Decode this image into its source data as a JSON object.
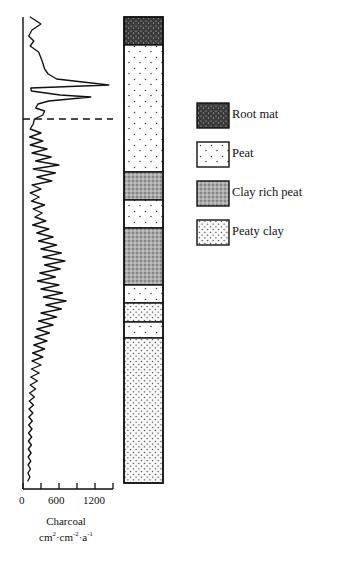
{
  "chart_data": {
    "type": "line",
    "title": "",
    "orientation": "vertical-depth-profile",
    "xlabel": "Charcoal",
    "xlabel_units": "cm2·cm-2·a-1",
    "ylabel": "",
    "xlim": [
      0,
      1500
    ],
    "xticks": [
      0,
      300,
      600,
      900,
      1200,
      1500
    ],
    "xtick_labels": [
      "0",
      "",
      "600",
      "",
      "1200",
      ""
    ],
    "grid": false,
    "legend_position": "right",
    "marker_line": {
      "type": "dashed-horizontal",
      "depth_px": 119
    },
    "series": [
      {
        "name": "Charcoal accumulation",
        "points": [
          [
            120,
            17
          ],
          [
            300,
            24
          ],
          [
            150,
            30
          ],
          [
            95,
            36
          ],
          [
            180,
            41
          ],
          [
            120,
            46
          ],
          [
            260,
            52
          ],
          [
            300,
            58
          ],
          [
            330,
            63
          ],
          [
            360,
            69
          ],
          [
            420,
            74
          ],
          [
            560,
            79
          ],
          [
            1430,
            85
          ],
          [
            130,
            88
          ],
          [
            140,
            91
          ],
          [
            620,
            95
          ],
          [
            1130,
            97
          ],
          [
            430,
            101
          ],
          [
            250,
            104
          ],
          [
            210,
            108
          ],
          [
            360,
            111
          ],
          [
            330,
            115
          ],
          [
            190,
            119
          ],
          [
            170,
            124
          ],
          [
            120,
            129
          ],
          [
            300,
            133
          ],
          [
            110,
            137
          ],
          [
            330,
            141
          ],
          [
            120,
            145
          ],
          [
            400,
            149
          ],
          [
            150,
            153
          ],
          [
            470,
            157
          ],
          [
            210,
            161
          ],
          [
            600,
            165
          ],
          [
            170,
            169
          ],
          [
            540,
            173
          ],
          [
            230,
            177
          ],
          [
            480,
            181
          ],
          [
            150,
            185
          ],
          [
            300,
            189
          ],
          [
            120,
            193
          ],
          [
            270,
            197
          ],
          [
            140,
            201
          ],
          [
            360,
            205
          ],
          [
            170,
            209
          ],
          [
            320,
            213
          ],
          [
            200,
            217
          ],
          [
            380,
            221
          ],
          [
            160,
            225
          ],
          [
            430,
            229
          ],
          [
            230,
            233
          ],
          [
            500,
            237
          ],
          [
            260,
            241
          ],
          [
            560,
            245
          ],
          [
            300,
            249
          ],
          [
            640,
            253
          ],
          [
            330,
            257
          ],
          [
            700,
            261
          ],
          [
            360,
            265
          ],
          [
            620,
            269
          ],
          [
            280,
            273
          ],
          [
            540,
            277
          ],
          [
            240,
            281
          ],
          [
            600,
            285
          ],
          [
            300,
            289
          ],
          [
            660,
            293
          ],
          [
            340,
            297
          ],
          [
            720,
            301
          ],
          [
            380,
            305
          ],
          [
            640,
            309
          ],
          [
            300,
            313
          ],
          [
            560,
            317
          ],
          [
            260,
            321
          ],
          [
            500,
            325
          ],
          [
            230,
            329
          ],
          [
            440,
            333
          ],
          [
            200,
            337
          ],
          [
            400,
            341
          ],
          [
            180,
            345
          ],
          [
            360,
            349
          ],
          [
            160,
            353
          ],
          [
            330,
            357
          ],
          [
            150,
            361
          ],
          [
            300,
            365
          ],
          [
            140,
            369
          ],
          [
            270,
            373
          ],
          [
            130,
            377
          ],
          [
            240,
            381
          ],
          [
            120,
            385
          ],
          [
            210,
            389
          ],
          [
            110,
            393
          ],
          [
            190,
            397
          ],
          [
            105,
            401
          ],
          [
            175,
            405
          ],
          [
            100,
            409
          ],
          [
            165,
            413
          ],
          [
            98,
            417
          ],
          [
            155,
            421
          ],
          [
            95,
            425
          ],
          [
            150,
            429
          ],
          [
            92,
            433
          ],
          [
            145,
            437
          ],
          [
            90,
            441
          ],
          [
            140,
            445
          ],
          [
            88,
            449
          ],
          [
            135,
            453
          ],
          [
            86,
            457
          ],
          [
            130,
            461
          ],
          [
            84,
            465
          ],
          [
            125,
            469
          ],
          [
            82,
            473
          ],
          [
            115,
            477
          ],
          [
            80,
            481
          ]
        ]
      }
    ],
    "stratigraphy": {
      "column_top_px": 17,
      "column_bottom_px": 483,
      "layers": [
        {
          "material": "Root mat",
          "top_px": 17,
          "bottom_px": 45
        },
        {
          "material": "Peat",
          "top_px": 45,
          "bottom_px": 172
        },
        {
          "material": "Clay rich peat",
          "top_px": 172,
          "bottom_px": 200
        },
        {
          "material": "Peat",
          "top_px": 200,
          "bottom_px": 228
        },
        {
          "material": "Clay rich peat",
          "top_px": 228,
          "bottom_px": 285
        },
        {
          "material": "Peat",
          "top_px": 285,
          "bottom_px": 303
        },
        {
          "material": "Peaty clay",
          "top_px": 303,
          "bottom_px": 322
        },
        {
          "material": "Peat",
          "top_px": 322,
          "bottom_px": 338
        },
        {
          "material": "Peaty clay",
          "top_px": 338,
          "bottom_px": 483
        }
      ]
    }
  },
  "axis": {
    "tick_labels": [
      {
        "value": 0,
        "text": "0"
      },
      {
        "value": 600,
        "text": "600"
      },
      {
        "value": 1200,
        "text": "1200"
      }
    ],
    "title_line1": "Charcoal",
    "title_line2_prefix": "cm",
    "title_line2_sup1": "2",
    "title_line2_mid": "·cm",
    "title_line2_sup2": "-2",
    "title_line2_mid2": "·a",
    "title_line2_sup3": "-1"
  },
  "legend": {
    "items": [
      {
        "label": "Root mat",
        "pattern": "root-mat"
      },
      {
        "label": "Peat",
        "pattern": "peat"
      },
      {
        "label": "Clay rich peat",
        "pattern": "clay-rich-peat"
      },
      {
        "label": "Peaty clay",
        "pattern": "peaty-clay"
      }
    ]
  }
}
